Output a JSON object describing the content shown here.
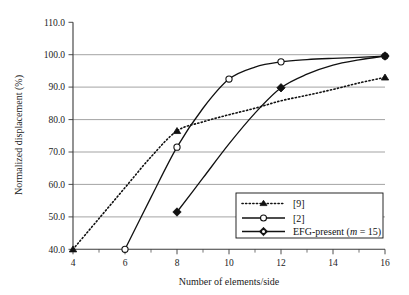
{
  "chart_data": {
    "type": "line",
    "title": "",
    "xlabel": "Number of elements/side",
    "ylabel": "Normalized displacement (%)",
    "xlim": [
      4,
      16
    ],
    "ylim": [
      40.0,
      110.0
    ],
    "xticks": [
      4,
      6,
      8,
      10,
      12,
      14,
      16
    ],
    "xtick_labels": [
      "4",
      "6",
      "8",
      "10",
      "12",
      "14",
      "16"
    ],
    "yticks": [
      40.0,
      50.0,
      60.0,
      70.0,
      80.0,
      90.0,
      100.0,
      110.0
    ],
    "ytick_labels": [
      "40.0",
      "50.0",
      "60.0",
      "70.0",
      "80.0",
      "90.0",
      "100.0",
      "110.0"
    ],
    "grid": "horizontal",
    "legend_position": "lower-right",
    "series": [
      {
        "name": "[9]",
        "marker": "triangle",
        "marker_fill": "filled",
        "linestyle": "dotted",
        "x": [
          4,
          8,
          16
        ],
        "y": [
          40.0,
          76.5,
          93.0
        ],
        "path_x": [
          4,
          5,
          6,
          7,
          8,
          9,
          10,
          11,
          12,
          13,
          14,
          15,
          16
        ],
        "path_y": [
          40.0,
          49.5,
          59.0,
          68.5,
          76.5,
          79.3,
          81.5,
          83.5,
          85.8,
          87.5,
          89.3,
          91.3,
          93.0
        ]
      },
      {
        "name": "[2]",
        "marker": "circle",
        "marker_fill": "open",
        "linestyle": "solid",
        "x": [
          6,
          8,
          10,
          12,
          16
        ],
        "y": [
          40.0,
          71.5,
          92.5,
          97.8,
          99.6
        ],
        "path_x": [
          6,
          7,
          8,
          9,
          10,
          11,
          12,
          13,
          14,
          15,
          16
        ],
        "path_y": [
          40.0,
          56.0,
          71.5,
          83.5,
          92.5,
          96.2,
          97.8,
          98.5,
          98.9,
          99.2,
          99.6
        ]
      },
      {
        "name": "EFG-present (m = 15)",
        "name_prefix": "EFG-present (",
        "name_italic": "m",
        "name_suffix": " = 15)",
        "marker": "diamond",
        "marker_fill": "filled",
        "linestyle": "solid",
        "x": [
          8,
          12,
          16
        ],
        "y": [
          51.5,
          89.8,
          99.6
        ],
        "path_x": [
          8,
          9,
          10,
          11,
          12,
          13,
          14,
          15,
          16
        ],
        "path_y": [
          51.5,
          62.0,
          72.5,
          82.0,
          89.8,
          94.0,
          96.8,
          98.4,
          99.6
        ]
      }
    ]
  },
  "legend": {
    "entries": [
      {
        "label": "[9]"
      },
      {
        "label": "[2]"
      },
      {
        "label_prefix": "EFG-present (",
        "label_italic": "m",
        "label_suffix": " = 15)"
      }
    ]
  }
}
